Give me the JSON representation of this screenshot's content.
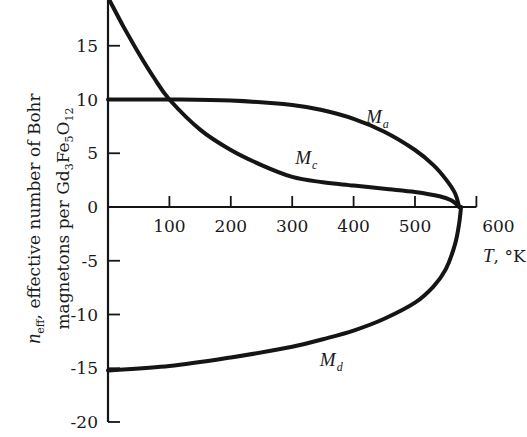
{
  "chart_data": {
    "type": "line",
    "title": "",
    "xlabel": "T, °K",
    "ylabel": "n_eff, effective number of Bohr magnetons per Gd3Fe5O12",
    "xlim": [
      0,
      600
    ],
    "ylim": [
      -20,
      20
    ],
    "x_ticks": [
      100,
      200,
      300,
      400,
      500,
      600
    ],
    "y_ticks": [
      15,
      10,
      5,
      0,
      -5,
      -10,
      -15,
      -20
    ],
    "grid": false,
    "legend": "none (curves labeled inline)",
    "series": [
      {
        "name": "M_a",
        "label": "M",
        "subscript": "a",
        "points": [
          [
            0,
            10.0
          ],
          [
            100,
            10.0
          ],
          [
            200,
            9.9
          ],
          [
            300,
            9.5
          ],
          [
            350,
            9.0
          ],
          [
            400,
            8.2
          ],
          [
            450,
            7.0
          ],
          [
            500,
            5.3
          ],
          [
            530,
            3.9
          ],
          [
            550,
            2.6
          ],
          [
            565,
            1.3
          ],
          [
            572,
            0
          ]
        ]
      },
      {
        "name": "M_c",
        "label": "M",
        "subscript": "c",
        "points": [
          [
            0,
            19.5
          ],
          [
            25,
            16.8
          ],
          [
            50,
            14.3
          ],
          [
            75,
            12.0
          ],
          [
            100,
            10.0
          ],
          [
            150,
            7.2
          ],
          [
            200,
            5.3
          ],
          [
            250,
            3.9
          ],
          [
            300,
            2.8
          ],
          [
            350,
            2.3
          ],
          [
            400,
            2.0
          ],
          [
            450,
            1.7
          ],
          [
            500,
            1.4
          ],
          [
            540,
            1.0
          ],
          [
            560,
            0.6
          ],
          [
            572,
            0
          ]
        ]
      },
      {
        "name": "M_d",
        "label": "M",
        "subscript": "d",
        "points": [
          [
            0,
            -15.2
          ],
          [
            100,
            -14.8
          ],
          [
            200,
            -14.0
          ],
          [
            300,
            -13.0
          ],
          [
            350,
            -12.3
          ],
          [
            400,
            -11.5
          ],
          [
            450,
            -10.4
          ],
          [
            500,
            -8.9
          ],
          [
            530,
            -7.4
          ],
          [
            550,
            -5.8
          ],
          [
            565,
            -3.5
          ],
          [
            572,
            -1.5
          ],
          [
            575,
            0
          ]
        ]
      }
    ],
    "annotations": [
      {
        "text": "M_a",
        "x": 420,
        "y": 7.8
      },
      {
        "text": "M_c",
        "x": 305,
        "y": 4.0
      },
      {
        "text": "M_d",
        "x": 345,
        "y": -14.8
      }
    ]
  },
  "labels": {
    "ylabel_line1_var": "n",
    "ylabel_line1_sub": "eff",
    "ylabel_line1_rest": ", effective number of Bohr",
    "ylabel_line2_pre": "magnetons per Gd",
    "ylabel_line2_sub1": "3",
    "ylabel_line2_mid1": "Fe",
    "ylabel_line2_sub2": "5",
    "ylabel_line2_mid2": "O",
    "ylabel_line2_sub3": "12",
    "xlabel_var": "T",
    "xlabel_unit": ", °K"
  }
}
